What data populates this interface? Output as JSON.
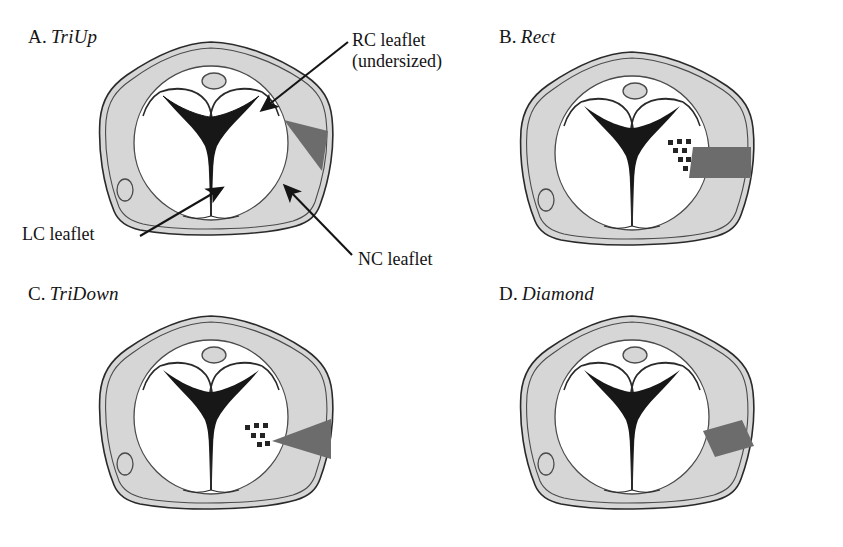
{
  "figure": {
    "background_color": "#ffffff",
    "ink_color": "#141414",
    "wall_fill": "#d6d6d6",
    "lumen_fill": "#ffffff",
    "coaptation_fill": "#171717",
    "patch_fill": "#6c6c6c",
    "outline_color": "#2a2a2a"
  },
  "panels": [
    {
      "id": "a",
      "letter": "A.",
      "name": "TriUp",
      "patch_shape": "triangle-up",
      "patch_description": "triangular patch, wide at lumen edge, narrowing outward",
      "stipple": false
    },
    {
      "id": "b",
      "letter": "B.",
      "name": "Rect",
      "patch_shape": "rectangle",
      "patch_description": "rectangular band patch of uniform width",
      "stipple": true
    },
    {
      "id": "c",
      "letter": "C.",
      "name": "TriDown",
      "patch_shape": "triangle-down",
      "patch_description": "triangular patch, narrow at lumen edge, widening outward",
      "stipple": true
    },
    {
      "id": "d",
      "letter": "D.",
      "name": "Diamond",
      "patch_shape": "diamond",
      "patch_description": "diamond / parallelogram shaped patch",
      "stipple": false
    }
  ],
  "annotations": {
    "rc": {
      "line1": "RC leaflet",
      "line2": "(undersized)"
    },
    "lc": {
      "line1": "LC leaflet"
    },
    "nc": {
      "line1": "NC leaflet"
    }
  }
}
